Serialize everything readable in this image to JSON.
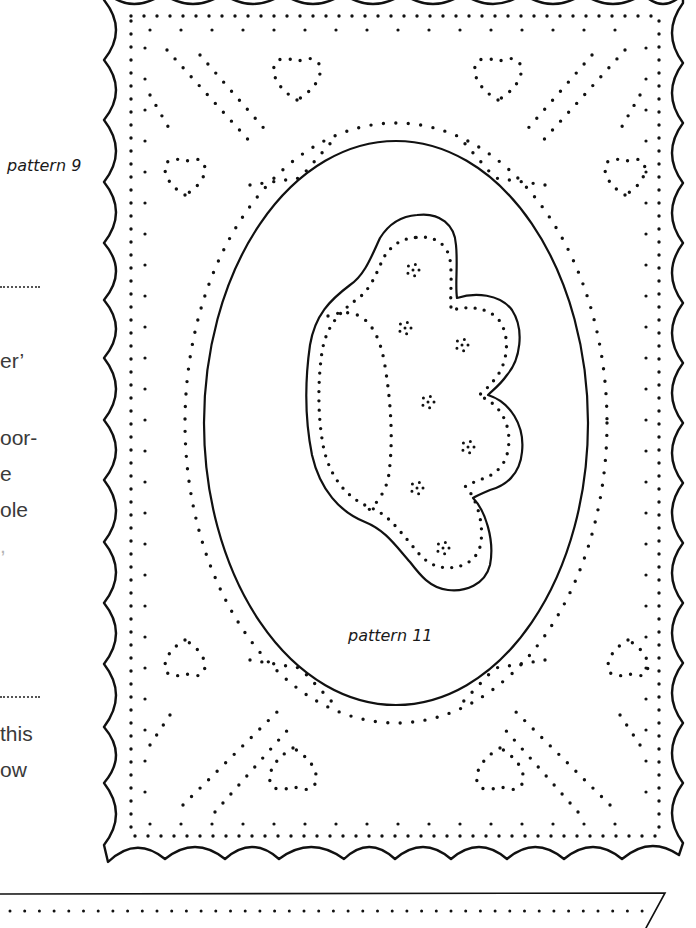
{
  "left_column": {
    "pattern_label": "pattern 9",
    "fragments": [
      "er’",
      "oor-",
      "e",
      "ole",
      ",",
      "this",
      "ow"
    ]
  },
  "center": {
    "pattern_label": "pattern 11"
  },
  "colors": {
    "ink": "#111111",
    "text": "#3a3a3a",
    "paper": "#ffffff"
  }
}
